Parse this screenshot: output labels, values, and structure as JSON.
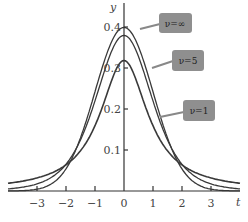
{
  "chart_data": {
    "type": "line",
    "title": "",
    "xlabel": "t",
    "ylabel": "y",
    "xlim": [
      -4,
      4
    ],
    "ylim": [
      0,
      0.43
    ],
    "grid": false,
    "x_ticks": [
      -3,
      -2,
      -1,
      0,
      1,
      2,
      3
    ],
    "x_tick_labels": [
      "−3",
      "−2",
      "−1",
      "0",
      "1",
      "2",
      "3"
    ],
    "y_ticks": [
      0.1,
      0.2,
      0.3,
      0.4
    ],
    "y_tick_labels": [
      "0.1",
      "0.2",
      "0.3",
      "0.4"
    ],
    "series": [
      {
        "name": "ν=∞",
        "dof": "inf",
        "x": [
          -4,
          -3,
          -2,
          -1,
          0,
          1,
          2,
          3,
          4
        ],
        "values": [
          0.0001,
          0.0044,
          0.054,
          0.242,
          0.399,
          0.242,
          0.054,
          0.0044,
          0.0001
        ]
      },
      {
        "name": "ν=5",
        "dof": 5,
        "x": [
          -4,
          -3,
          -2,
          -1,
          0,
          1,
          2,
          3,
          4
        ],
        "values": [
          0.0051,
          0.0173,
          0.0651,
          0.2197,
          0.3796,
          0.2197,
          0.0651,
          0.0173,
          0.0051
        ]
      },
      {
        "name": "ν=1",
        "dof": 1,
        "x": [
          -4,
          -3,
          -2,
          -1,
          0,
          1,
          2,
          3,
          4
        ],
        "values": [
          0.0187,
          0.0318,
          0.0637,
          0.1592,
          0.3183,
          0.1592,
          0.0637,
          0.0318,
          0.0187
        ]
      }
    ],
    "annotations": [
      {
        "text": "ν=∞",
        "position": "upper right, boxed callout"
      },
      {
        "text": "ν=5",
        "position": "middle right, boxed callout"
      },
      {
        "text": "ν=1",
        "position": "lower right, boxed callout"
      }
    ],
    "legend_position": "callouts on right side"
  },
  "axes": {
    "x_label": "t",
    "y_label": "y"
  },
  "callouts": [
    {
      "label": "ν=∞"
    },
    {
      "label": "ν=5"
    },
    {
      "label": "ν=1"
    }
  ]
}
